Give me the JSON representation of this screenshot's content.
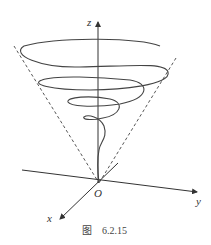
{
  "figure": {
    "caption_prefix": "图",
    "caption_number": "6.2.15",
    "axes": {
      "z_label": "z",
      "y_label": "y",
      "x_label": "x",
      "origin_label": "O"
    },
    "elements": [
      "cone-dashed-generators",
      "conical-helix",
      "coordinate-axes"
    ],
    "colors": {
      "line": "#333333",
      "background": "#ffffff"
    }
  }
}
